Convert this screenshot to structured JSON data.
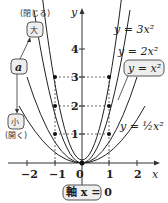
{
  "diagram": {
    "axes": {
      "x_label": "x",
      "y_label": "y",
      "origin_label": "0",
      "x_ticks": [
        "−2",
        "−1",
        "1",
        "2"
      ],
      "y_ticks": [
        "1",
        "2",
        "3",
        "4"
      ]
    },
    "curves": [
      {
        "label": "y = 3x²",
        "a": 3
      },
      {
        "label": "y = 2x²",
        "a": 2
      },
      {
        "label": "y = x²",
        "a": 1,
        "boxed": true
      },
      {
        "label": "y = ½x²",
        "a": 0.5
      }
    ],
    "parameter": {
      "name": "a",
      "large": "大",
      "large_note": "(閉じる)",
      "small": "小",
      "small_note": "(開く)"
    },
    "axis_of_symmetry": "軸 x = 0",
    "colors": {
      "line": "#222222",
      "box_fill": "#eeeeee",
      "box_stroke": "#555555"
    }
  }
}
